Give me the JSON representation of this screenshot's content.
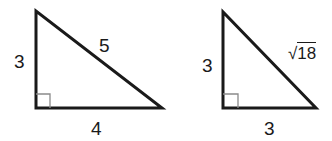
{
  "figures": [
    {
      "name": "triangle-1",
      "type": "right-triangle",
      "sides": {
        "left": "3",
        "hypotenuse": "5",
        "bottom": "4"
      },
      "right_angle_marker": true
    },
    {
      "name": "triangle-2",
      "type": "right-triangle",
      "sides": {
        "left": "3",
        "hypotenuse_radical": "√",
        "hypotenuse_radicand": "18",
        "bottom": "3"
      },
      "right_angle_marker": true
    }
  ],
  "colors": {
    "stroke": "#1a1a1a",
    "marker": "#8a8a8a",
    "background": "#ffffff"
  }
}
